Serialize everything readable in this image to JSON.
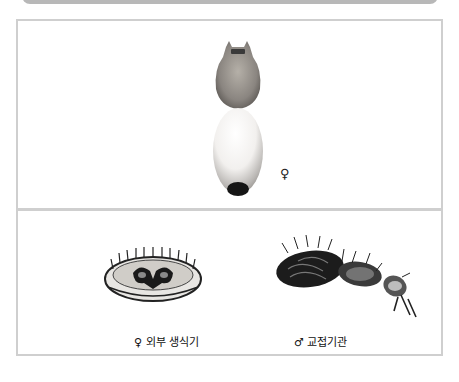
{
  "figure": {
    "top_panel": {
      "specimen": "spider-dorsal-view",
      "sex_symbol": "♀"
    },
    "bottom_panel": {
      "captions": [
        {
          "symbol": "♀",
          "text": "외부 생식기"
        },
        {
          "symbol": "♂",
          "text": "교접기관"
        }
      ]
    }
  },
  "captions_full": {
    "left": "♀ 외부 생식기",
    "right": "♂ 교접기관"
  }
}
